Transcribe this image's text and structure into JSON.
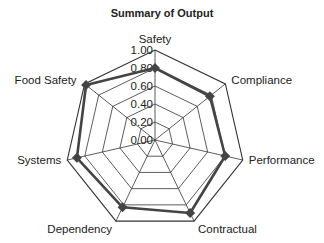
{
  "chart_data": {
    "type": "radar",
    "title": "Summary of Output",
    "categories": [
      "Safety",
      "Compliance",
      "Performance",
      "Contractual",
      "Dependency",
      "Systems",
      "Food Safety"
    ],
    "series": [
      {
        "name": "Output",
        "values": [
          0.8,
          0.78,
          0.8,
          0.9,
          0.83,
          0.89,
          0.98
        ],
        "color": "#444444"
      }
    ],
    "rlim": [
      0,
      1
    ],
    "ticks": [
      "0.00",
      "0.20",
      "0.40",
      "0.60",
      "0.80",
      "1.00"
    ],
    "grid": true,
    "legend": "none"
  },
  "layout": {
    "center": [
      155,
      140
    ],
    "radius": 90,
    "grid_color": "#333333",
    "series_color": "#444444"
  }
}
